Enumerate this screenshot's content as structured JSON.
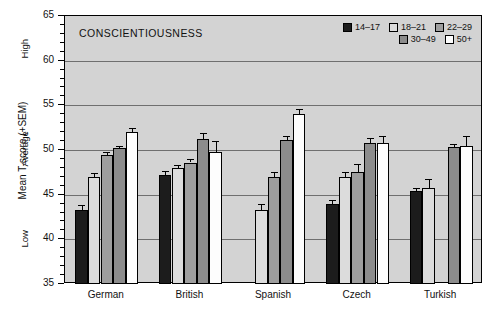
{
  "chart_data": {
    "type": "bar",
    "title": "CONSCIENTIOUSNESS",
    "xlabel": "",
    "ylabel": "Mean T-score (+SEM)",
    "ylim": [
      35,
      65
    ],
    "yticks": [
      35,
      40,
      45,
      50,
      55,
      60,
      65
    ],
    "ytick_labels": [
      "35",
      "40",
      "45",
      "50",
      "55",
      "60",
      "65"
    ],
    "grid": true,
    "gridlines": [
      40,
      45,
      50,
      55,
      60
    ],
    "legend_position": "top-right",
    "y_band_labels": [
      "High",
      "Average",
      "Low"
    ],
    "categories": [
      "German",
      "British",
      "Spanish",
      "Czech",
      "Turkish"
    ],
    "series": [
      {
        "name": "14–17",
        "color": "#1c1c1c",
        "values": [
          43.3,
          47.2,
          null,
          43.9,
          45.4
        ],
        "sem": [
          0.55,
          0.45,
          null,
          0.45,
          0.3
        ]
      },
      {
        "name": "18–21",
        "color": "#dcdcdc",
        "values": [
          47.0,
          48.0,
          43.3,
          47.0,
          45.8
        ],
        "sem": [
          0.45,
          0.35,
          0.6,
          0.55,
          1.0
        ]
      },
      {
        "name": "22–29",
        "color": "#9e9e9e",
        "values": [
          49.4,
          48.6,
          47.0,
          47.5,
          null
        ],
        "sem": [
          0.4,
          0.4,
          0.55,
          0.9,
          null
        ]
      },
      {
        "name": "30–49",
        "color": "#8c8c8c",
        "values": [
          50.2,
          51.2,
          51.1,
          50.8,
          50.3
        ],
        "sem": [
          0.25,
          0.7,
          0.5,
          0.55,
          0.4
        ]
      },
      {
        "name": "50+",
        "color": "#fdfdfd",
        "values": [
          52.0,
          49.8,
          54.0,
          50.8,
          50.4
        ],
        "sem": [
          0.45,
          1.25,
          0.6,
          0.8,
          1.2
        ]
      }
    ]
  }
}
